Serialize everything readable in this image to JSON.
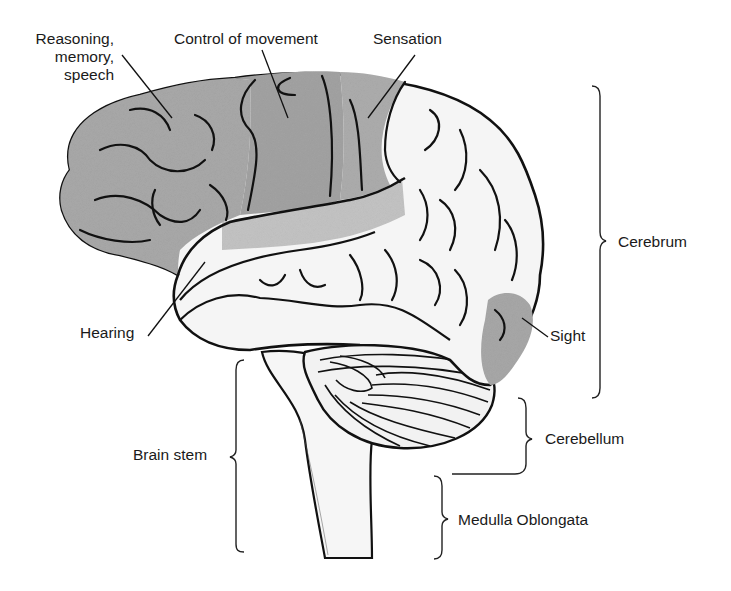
{
  "diagram": {
    "colors": {
      "background": "#ffffff",
      "outline": "#111111",
      "shaded_region": "#a9a9a9",
      "light_shaded_region": "#c4c4c4",
      "unshaded_region": "#f4f4f4",
      "label_text": "#1a1a1a"
    },
    "function_labels": {
      "reasoning": {
        "line1": "Reasoning,",
        "line2": "memory,",
        "line3": "speech"
      },
      "movement": "Control of movement",
      "sensation": "Sensation",
      "hearing": "Hearing",
      "sight": "Sight"
    },
    "structure_labels": {
      "cerebrum": "Cerebrum",
      "cerebellum": "Cerebellum",
      "brain_stem": "Brain stem",
      "medulla": "Medulla Oblongata"
    }
  }
}
